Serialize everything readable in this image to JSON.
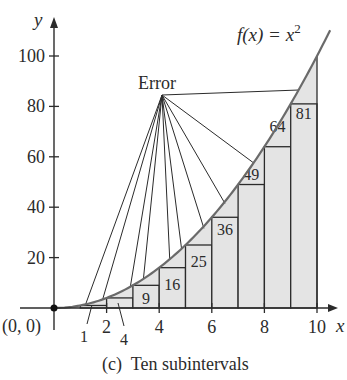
{
  "chart_data": {
    "type": "bar",
    "function_label": "f(x) = x",
    "function_exponent": "2",
    "caption": "(c)  Ten subintervals",
    "xlabel": "x",
    "ylabel": "y",
    "origin_label": "(0, 0)",
    "error_label": "Error",
    "x_ticks": [
      "2",
      "4",
      "6",
      "8",
      "10"
    ],
    "y_ticks": [
      "20",
      "40",
      "60",
      "80",
      "100"
    ],
    "xlim": [
      0,
      10
    ],
    "ylim": [
      0,
      100
    ],
    "categories": [
      "[0,1]",
      "[1,2]",
      "[2,3]",
      "[3,4]",
      "[4,5]",
      "[5,6]",
      "[6,7]",
      "[7,8]",
      "[8,9]",
      "[9,10]"
    ],
    "values": [
      0,
      1,
      4,
      9,
      16,
      25,
      36,
      49,
      64,
      81
    ],
    "bar_labels": [
      "",
      "1",
      "4",
      "9",
      "16",
      "25",
      "36",
      "49",
      "64",
      "81"
    ],
    "grid": false
  },
  "colors": {
    "fill": "#e4e4e4",
    "line": "#2b2b2b",
    "curve": "#6a6a6a"
  }
}
